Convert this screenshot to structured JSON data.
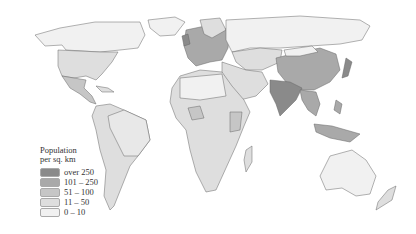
{
  "legend": {
    "title_line1": "Population",
    "title_line2": "per sq. km",
    "items": [
      {
        "label": "over 250",
        "color": "#8a8a8a"
      },
      {
        "label": "101 – 250",
        "color": "#a9a9a9"
      },
      {
        "label": "51 – 100",
        "color": "#c6c6c6"
      },
      {
        "label": "11 – 50",
        "color": "#dedede"
      },
      {
        "label": "0 – 10",
        "color": "#f1f1f1"
      }
    ]
  },
  "map": {
    "subject": "World population density",
    "regions": [
      {
        "name": "North America (Canada)",
        "class": "0 – 10"
      },
      {
        "name": "United States",
        "class": "11 – 50"
      },
      {
        "name": "Mexico",
        "class": "51 – 100"
      },
      {
        "name": "South America",
        "class": "11 – 50"
      },
      {
        "name": "Europe",
        "class": "101 – 250"
      },
      {
        "name": "Africa",
        "class": "11 – 50"
      },
      {
        "name": "Russia",
        "class": "0 – 10"
      },
      {
        "name": "China",
        "class": "101 – 250"
      },
      {
        "name": "India",
        "class": "over 250"
      },
      {
        "name": "Southeast Asia",
        "class": "101 – 250"
      },
      {
        "name": "Australia",
        "class": "0 – 10"
      }
    ]
  }
}
